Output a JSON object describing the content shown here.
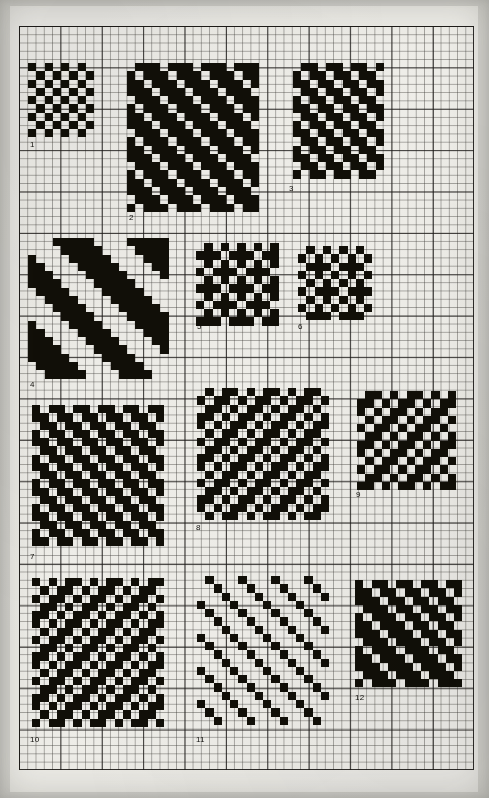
{
  "page": {
    "kind": "scanned-graph-paper-plate",
    "background_color": "#f2f1ec",
    "ink_color": "#17150f",
    "grid": {
      "cell_px": 8.28,
      "heavy_every": 5,
      "light_line_color": "#3c3a36",
      "heavy_line_color": "#1c1a18",
      "columns": 55,
      "rows": 90
    }
  },
  "drafts": [
    {
      "number": "1",
      "label": "1",
      "cols": 8,
      "rows": 9,
      "left": 28,
      "top": 63,
      "label_left": 30,
      "label_top": 141,
      "grid": [
        "10101010",
        "01010101",
        "10101010",
        "01010101",
        "10101010",
        "01010101",
        "10101010",
        "01010101",
        "10101010"
      ]
    },
    {
      "number": "2",
      "label": "2",
      "cols": 16,
      "rows": 18,
      "left": 127,
      "top": 63,
      "label_left": 129,
      "label_top": 214,
      "grid": [
        "0111011101110111",
        "1011101110111011",
        "1101110111011101",
        "1110111011101110",
        "0111011101110111",
        "1011101110111011",
        "1101110111011101",
        "1110111011101110",
        "0111011101110111",
        "1011101110111011",
        "1101110111011101",
        "1110111011101110",
        "0111011101110111",
        "1011101110111011",
        "1101110111011101",
        "1110111011101110",
        "0111011101110111",
        "1011101110111011"
      ]
    },
    {
      "number": "3",
      "label": "3",
      "cols": 11,
      "rows": 14,
      "left": 293,
      "top": 63,
      "label_left": 289,
      "label_top": 185,
      "grid": [
        "01101101101",
        "10110110110",
        "11011011011",
        "01101101101",
        "10110110110",
        "11011011011",
        "01101101101",
        "10110110110",
        "11011011011",
        "01101101101",
        "10110110110",
        "11011011011",
        "01101101101",
        "10110110110"
      ]
    },
    {
      "number": "4",
      "label": "4",
      "cols": 17,
      "rows": 17,
      "left": 28,
      "top": 238,
      "label_left": 30,
      "label_top": 381,
      "grid": [
        "00011111000011111",
        "00001111100001111",
        "10000111110000111",
        "11000011111000011",
        "11100001111100001",
        "11110000111110000",
        "01111000011111000",
        "00111100001111100",
        "00011110000111110",
        "00001111000011111",
        "10000111100001111",
        "11000011110000111",
        "11100001111000011",
        "11110000111100001",
        "11111000011110000",
        "01111100001111000",
        "00111110000111100"
      ]
    },
    {
      "number": "5",
      "label": "5",
      "cols": 10,
      "rows": 10,
      "left": 196,
      "top": 243,
      "label_left": 197,
      "label_top": 323,
      "grid": [
        "0101010101",
        "1110111011",
        "0101010101",
        "1011101110",
        "0101010101",
        "1110111011",
        "0101010101",
        "1011101110",
        "0101010101",
        "1110111011"
      ]
    },
    {
      "number": "6",
      "label": "6",
      "cols": 9,
      "rows": 9,
      "left": 298,
      "top": 246,
      "label_left": 298,
      "label_top": 323,
      "grid": [
        "010101010",
        "101010101",
        "011101110",
        "101010101",
        "010101010",
        "101110111",
        "010101010",
        "101010101",
        "011101110"
      ]
    },
    {
      "number": "7",
      "label": "7",
      "cols": 16,
      "rows": 17,
      "left": 32,
      "top": 405,
      "label_left": 30,
      "label_top": 553,
      "grid": [
        "1011011011011011",
        "1101101101101101",
        "0110110110110110",
        "1011011011011011",
        "1101101101101101",
        "0110110110110110",
        "1011011011011011",
        "1101101101101101",
        "0110110110110110",
        "1011011011011011",
        "1101101101101101",
        "0110110110110110",
        "1011011011011011",
        "1101101101101101",
        "0110110110110110",
        "1011011011011011",
        "1101101101101101"
      ]
    },
    {
      "number": "8",
      "label": "8",
      "cols": 16,
      "rows": 16,
      "left": 197,
      "top": 388,
      "label_left": 196,
      "label_top": 524,
      "grid": [
        "0101101011010110",
        "1011010110101101",
        "0110101101011010",
        "1101011010110101",
        "1010110101101011",
        "0101101011010110",
        "1011010110101101",
        "0110101101011010",
        "1101011010110101",
        "1010110101101011",
        "0101101011010110",
        "1011010110101101",
        "0110101101011010",
        "1101011010110101",
        "1010110101101011",
        "0101101011010110"
      ]
    },
    {
      "number": "9",
      "label": "9",
      "cols": 12,
      "rows": 12,
      "left": 357,
      "top": 391,
      "label_left": 356,
      "label_top": 491,
      "grid": [
        "011010110101",
        "110101101011",
        "101011010110",
        "010110101101",
        "101101011010",
        "011010110101",
        "110101101011",
        "101011010110",
        "010110101101",
        "101101011010",
        "011010110101",
        "110101101011"
      ]
    },
    {
      "number": "10",
      "label": "10",
      "cols": 16,
      "rows": 18,
      "left": 32,
      "top": 578,
      "label_left": 30,
      "label_top": 736,
      "grid": [
        "1010110101101011",
        "0101101011010110",
        "1011010110101101",
        "0110101101011010",
        "1101011010110101",
        "1010110101101011",
        "0101101011010110",
        "1011010110101101",
        "0110101101011010",
        "1101011010110101",
        "1010110101101011",
        "0101101011010110",
        "1011010110101101",
        "0110101101011010",
        "1101011010110101",
        "1010110101101011",
        "0101101011010110",
        "1011010110101101"
      ]
    },
    {
      "number": "11",
      "label": "11",
      "cols": 16,
      "rows": 18,
      "left": 197,
      "top": 576,
      "label_left": 196,
      "label_top": 736,
      "grid": [
        "0100010001000100",
        "0010001000100010",
        "0001000100010001",
        "1000100010001000",
        "0100010001000100",
        "0010001000100010",
        "0001000100010001",
        "1000100010001000",
        "0100010001000100",
        "0010001000100010",
        "0001000100010001",
        "1000100010001000",
        "0100010001000100",
        "0010001000100010",
        "0001000100010001",
        "1000100010001000",
        "0100010001000100",
        "0010001000100010"
      ]
    },
    {
      "number": "12",
      "label": "12",
      "cols": 13,
      "rows": 13,
      "left": 355,
      "top": 580,
      "label_left": 355,
      "label_top": 694,
      "grid": [
        "1011011011011",
        "1101101101101",
        "1110110110110",
        "0111011011011",
        "1011101101101",
        "1101110110110",
        "1110111011011",
        "0111011101101",
        "1011101110110",
        "1101110111011",
        "1110111011101",
        "0111011101110",
        "1011101110111"
      ]
    }
  ]
}
